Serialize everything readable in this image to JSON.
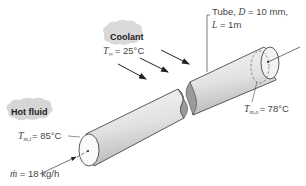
{
  "diagram": {
    "type": "heat-exchanger-tube-schematic",
    "coolant": {
      "label": "Coolant",
      "temp_symbol": "T",
      "temp_subscript": "∞",
      "temp_value": "= 25°C"
    },
    "tube": {
      "line1_prefix": "Tube, ",
      "line1_symbol": "D",
      "line1_value": " = 10 mm,",
      "line2_symbol": "L",
      "line2_value": " = 1m"
    },
    "hot_fluid": {
      "label": "Hot fluid",
      "inlet_symbol": "T",
      "inlet_subscript": "m,i",
      "inlet_value": "= 85°C",
      "flow_symbol": "ṁ",
      "flow_value": " = 18 kg/h"
    },
    "outlet": {
      "symbol": "T",
      "subscript": "m,o",
      "value": "= 78°C"
    },
    "colors": {
      "tube_fill_light": "#f4f4f4",
      "tube_fill_dark": "#c8c8c8",
      "cloud_fill": "#d6d6d6",
      "stroke": "#333333",
      "text": "#444444"
    }
  }
}
